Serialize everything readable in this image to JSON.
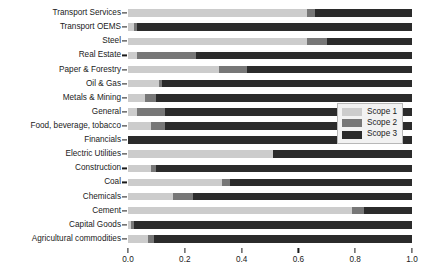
{
  "chart_data": {
    "type": "bar",
    "orientation": "horizontal",
    "stacked": true,
    "normalized": true,
    "title": "",
    "xlabel": "",
    "ylabel": "",
    "xlim": [
      0.0,
      1.0
    ],
    "grid": false,
    "legend_position": "center-right",
    "xticks": [
      "0.0",
      "0.2",
      "0.4",
      "0.6",
      "0.8",
      "1.0"
    ],
    "xtick_values": [
      0.0,
      0.2,
      0.4,
      0.6,
      0.8,
      1.0
    ],
    "categories": [
      "Transport Services",
      "Transport OEMS",
      "Steel",
      "Real Estate",
      "Paper & Forestry",
      "Oil & Gas",
      "Metals & Mining",
      "General",
      "Food, beverage, tobacco",
      "Financials",
      "Electric Utilities",
      "Construction",
      "Coal",
      "Chemicals",
      "Cement",
      "Capital Goods",
      "Agricultural commodities"
    ],
    "series": [
      {
        "name": "Scope 1",
        "color": "#cccccc",
        "values": [
          0.63,
          0.02,
          0.63,
          0.03,
          0.32,
          0.11,
          0.06,
          0.03,
          0.08,
          0.0,
          0.51,
          0.08,
          0.33,
          0.16,
          0.79,
          0.01,
          0.07
        ]
      },
      {
        "name": "Scope 2",
        "color": "#777777",
        "values": [
          0.03,
          0.01,
          0.07,
          0.21,
          0.1,
          0.01,
          0.04,
          0.1,
          0.05,
          0.0,
          0.0,
          0.02,
          0.03,
          0.07,
          0.04,
          0.01,
          0.02
        ]
      },
      {
        "name": "Scope 3",
        "color": "#2b2b2b",
        "values": [
          0.34,
          0.97,
          0.3,
          0.76,
          0.58,
          0.88,
          0.9,
          0.87,
          0.87,
          1.0,
          0.49,
          0.9,
          0.64,
          0.77,
          0.17,
          0.98,
          0.91
        ]
      }
    ]
  },
  "legend": {
    "items": [
      {
        "label": "Scope 1",
        "color": "#cccccc"
      },
      {
        "label": "Scope 2",
        "color": "#777777"
      },
      {
        "label": "Scope 3",
        "color": "#2b2b2b"
      }
    ]
  }
}
